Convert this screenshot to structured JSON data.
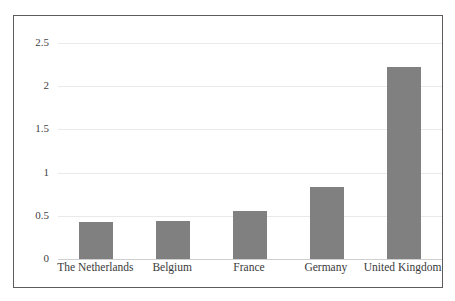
{
  "chart_data": {
    "type": "bar",
    "title": "",
    "subtitle": "",
    "xlabel": "",
    "ylabel": "",
    "categories": [
      "The Netherlands",
      "Belgium",
      "France",
      "Germany",
      "United Kingdom"
    ],
    "values": [
      0.43,
      0.44,
      0.56,
      0.83,
      2.22
    ],
    "series": [
      {
        "name": "",
        "values": [
          0.43,
          0.44,
          0.56,
          0.83,
          2.22
        ]
      }
    ],
    "ylim": [
      0,
      2.5
    ],
    "ytick_values": [
      0,
      0.5,
      1,
      1.5,
      2,
      2.5
    ],
    "ytick_labels": [
      "0",
      "0.5",
      "1",
      "1.5",
      "2",
      "2.5"
    ],
    "grid": true,
    "grid_axis": "y",
    "legend": false,
    "legend_position": "none",
    "annotations": [],
    "colors": {
      "bar": "#808080",
      "frame_border": "#5c5c5c",
      "gridline": "#e9e9e9",
      "baseline": "#cfcfcf",
      "background": "#ffffff",
      "text": "#3a3a3a"
    }
  }
}
